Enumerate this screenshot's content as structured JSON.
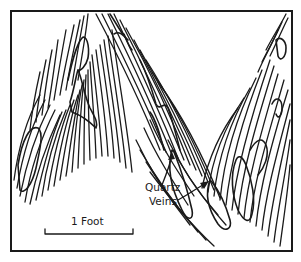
{
  "figure": {
    "type": "geological sketch",
    "labels": {
      "vein_label_line1": "Quartz",
      "vein_label_line2": "Veins"
    },
    "scale_bar": {
      "label": "1 Foot"
    },
    "colors": {
      "ink": "#1a1a1a",
      "background": "#ffffff"
    }
  }
}
